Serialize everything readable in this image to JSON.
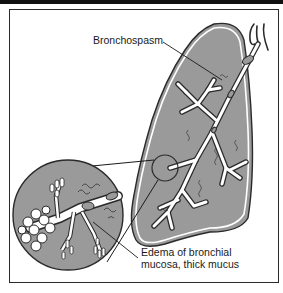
{
  "diagram": {
    "type": "medical-illustration",
    "labels": {
      "bronchospasm": "Bronchospasm",
      "edema_line1": "Edema of bronchial",
      "edema_line2": "mucosa, thick mucus"
    },
    "colors": {
      "lung_fill": "#9a9a9a",
      "outline": "#2a2a2a",
      "airway": "#ffffff",
      "band": "#111111"
    }
  }
}
